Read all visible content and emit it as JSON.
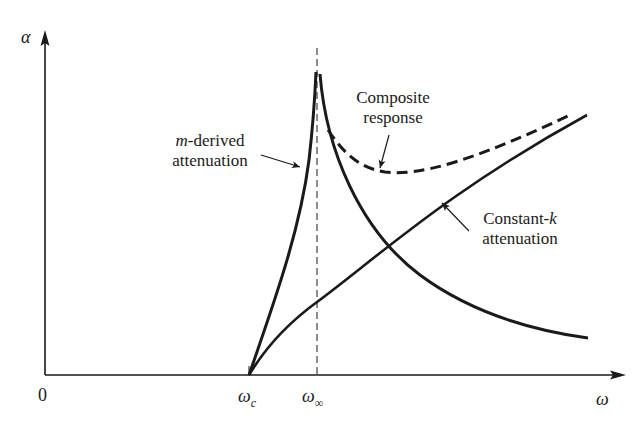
{
  "diagram": {
    "axes": {
      "y_label": "α",
      "x_label": "ω",
      "origin_label": "0"
    },
    "ticks": {
      "omega_c": {
        "base": "ω",
        "sub": "c"
      },
      "omega_inf": {
        "base": "ω",
        "sub": "∞"
      }
    },
    "annotations": {
      "m_derived": {
        "prefix": "m",
        "line1_rest": "-derived",
        "line2": "attenuation"
      },
      "composite": {
        "line1": "Composite",
        "line2": "response"
      },
      "constant_k": {
        "line1_rest": "Constant-",
        "suffix": "k",
        "line2": "attenuation"
      }
    },
    "curves": [
      {
        "name": "m-derived attenuation",
        "style": "solid"
      },
      {
        "name": "Constant-k attenuation",
        "style": "solid"
      },
      {
        "name": "Composite response",
        "style": "dashed"
      }
    ],
    "colors": {
      "ink": "#1a1a1a",
      "background": "#ffffff"
    }
  }
}
